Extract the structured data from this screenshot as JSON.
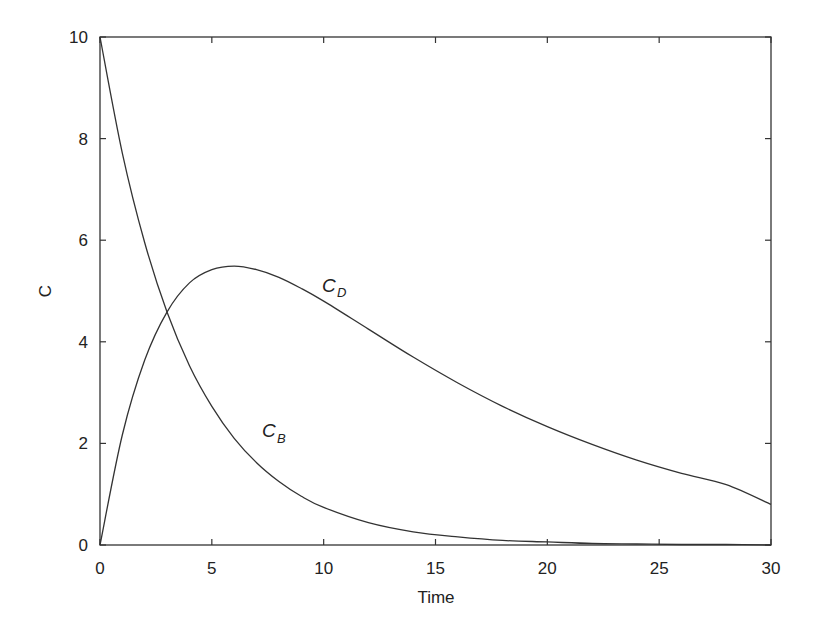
{
  "chart_data": {
    "type": "line",
    "title": "",
    "xlabel": "Time",
    "ylabel": "C",
    "xlim": [
      0,
      30
    ],
    "ylim": [
      0,
      10
    ],
    "xticks": [
      0,
      5,
      10,
      15,
      20,
      25,
      30
    ],
    "yticks": [
      0,
      2,
      4,
      6,
      8,
      10
    ],
    "grid": false,
    "legend": "none (inline curve labels)",
    "x": [
      0,
      1,
      2,
      3,
      4,
      5,
      6,
      7,
      8,
      9,
      10,
      12,
      14,
      16,
      18,
      20,
      22,
      24,
      26,
      28,
      30
    ],
    "series": [
      {
        "name": "C_B",
        "label": "C",
        "subscript": "B",
        "values": [
          10.0,
          7.71,
          5.95,
          4.58,
          3.53,
          2.73,
          2.1,
          1.62,
          1.25,
          0.96,
          0.74,
          0.44,
          0.26,
          0.16,
          0.09,
          0.06,
          0.03,
          0.02,
          0.01,
          0.01,
          0.0
        ]
      },
      {
        "name": "C_D",
        "label": "C",
        "subscript": "D",
        "values": [
          0.0,
          2.17,
          3.64,
          4.59,
          5.16,
          5.42,
          5.49,
          5.42,
          5.27,
          5.05,
          4.8,
          4.25,
          3.7,
          3.19,
          2.73,
          2.33,
          1.98,
          1.67,
          1.41,
          1.19,
          0.8
        ]
      }
    ],
    "annotations": [
      {
        "text": "C_D",
        "at_x": 10.0,
        "at_y": 5.0
      },
      {
        "text": "C_B",
        "at_x": 7.3,
        "at_y": 2.2
      }
    ]
  }
}
